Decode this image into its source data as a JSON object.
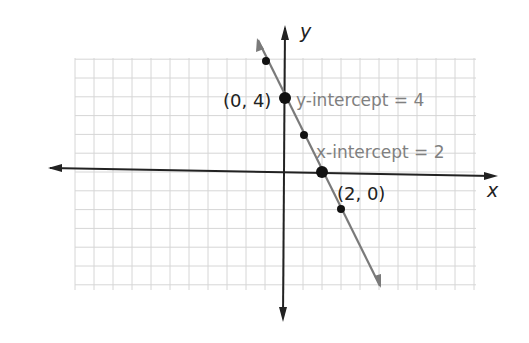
{
  "chart_data": {
    "type": "line",
    "title": "",
    "xlabel": "x",
    "ylabel": "y",
    "equation_points": [
      {
        "x": -1,
        "y": 6
      },
      {
        "x": 0,
        "y": 4
      },
      {
        "x": 1,
        "y": 2
      },
      {
        "x": 2,
        "y": 0
      },
      {
        "x": 3,
        "y": -2
      }
    ],
    "slope": -2,
    "y_intercept": 4,
    "x_intercept": 2,
    "highlighted_points": [
      {
        "x": 0,
        "y": 4,
        "label": "(0, 4)"
      },
      {
        "x": 2,
        "y": 0,
        "label": "(2, 0)"
      }
    ],
    "annotations": [
      {
        "text": "y-intercept = 4",
        "near": {
          "x": 0,
          "y": 4
        }
      },
      {
        "text": "x-intercept = 2",
        "near": {
          "x": 2,
          "y": 0
        }
      }
    ],
    "grid": true,
    "xlim": [
      -11,
      10
    ],
    "ylim": [
      -6,
      6
    ]
  },
  "labels": {
    "x_axis": "x",
    "y_axis": "y",
    "point_y_intercept": "(0, 4)",
    "point_x_intercept": "(2, 0)",
    "annotation_y": "y-intercept = 4",
    "annotation_x": "x-intercept = 2"
  },
  "colors": {
    "axis": "#222222",
    "line": "#7a7a7a",
    "grid": "#d6d6d6",
    "annotation": "#808080",
    "point": "#111111"
  }
}
